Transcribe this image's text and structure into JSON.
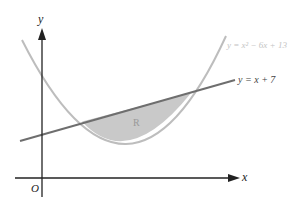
{
  "axes": {
    "x_label": "x",
    "y_label": "y",
    "origin_label": "O"
  },
  "curves": {
    "parabola": {
      "equation": "y = x² − 6x + 13",
      "color": "#bdbdbd"
    },
    "line": {
      "equation": "y = x + 7",
      "color": "#6e6e6e"
    }
  },
  "region": {
    "label": "R",
    "fill": "#c9c9c9"
  }
}
